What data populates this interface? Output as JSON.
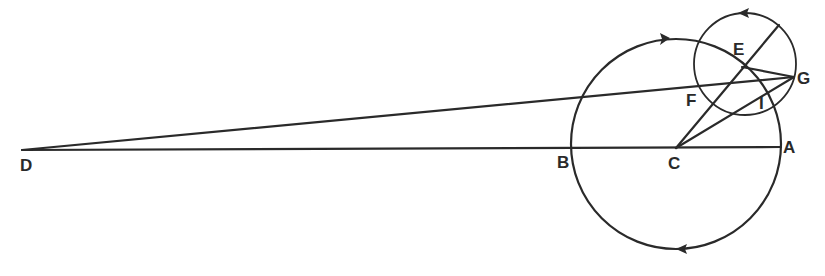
{
  "diagram": {
    "stroke_color": "#2a2a2a",
    "deferent": {
      "center": [
        676,
        144
      ],
      "radius": 105
    },
    "epicycle": {
      "center": [
        745,
        64
      ],
      "radius": 51
    },
    "labels": {
      "A": "A",
      "B": "B",
      "C": "C",
      "D": "D",
      "E": "E",
      "F": "F",
      "G": "G",
      "I": "I"
    },
    "points": {
      "A": [
        780,
        148
      ],
      "B": [
        572,
        148
      ],
      "C": [
        676,
        148
      ],
      "D": [
        22,
        150
      ],
      "E": [
        742,
        67
      ],
      "G": [
        794,
        77
      ],
      "I": [
        760,
        103
      ]
    },
    "arrows": [
      {
        "name": "deferent-top-arrow",
        "direction": "clockwise"
      },
      {
        "name": "deferent-bottom-arrow",
        "direction": "clockwise"
      },
      {
        "name": "epicycle-top-arrow",
        "direction": "counterclockwise"
      }
    ]
  }
}
